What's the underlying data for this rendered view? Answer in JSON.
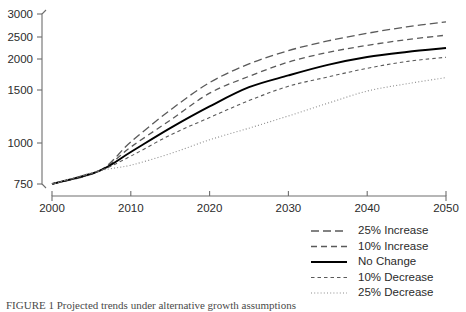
{
  "chart_data": {
    "type": "line",
    "title": "",
    "subtitle": "",
    "xlabel": "",
    "ylabel": "",
    "xlim": [
      2000,
      2050
    ],
    "ylim": [
      750,
      3000
    ],
    "yscale": "nonlinear-compressed",
    "grid": false,
    "legend_position": "bottom-right",
    "xticks": [
      2000,
      2010,
      2020,
      2030,
      2040,
      2050
    ],
    "xtick_labels": [
      "2000",
      "2010",
      "2020",
      "2030",
      "2040",
      "2050"
    ],
    "yticks": [
      750,
      1000,
      1500,
      2000,
      2500,
      3000
    ],
    "ytick_labels": [
      "750",
      "1000",
      "1500",
      "2000",
      "2500",
      "3000"
    ],
    "x": [
      2000,
      2006,
      2010,
      2015,
      2020,
      2025,
      2030,
      2035,
      2040,
      2045,
      2050
    ],
    "series": [
      {
        "name": "25% Increase",
        "dash": "long-dash",
        "color": "#5a5a5a",
        "width": 1.3,
        "values": [
          750,
          830,
          1010,
          1310,
          1620,
          1920,
          2190,
          2410,
          2580,
          2720,
          2830
        ]
      },
      {
        "name": "10% Increase",
        "dash": "medium-dash",
        "color": "#5a5a5a",
        "width": 1.3,
        "values": [
          750,
          830,
          975,
          1215,
          1470,
          1720,
          1950,
          2150,
          2310,
          2440,
          2540
        ]
      },
      {
        "name": "No Change",
        "dash": "solid",
        "color": "#000000",
        "width": 1.9,
        "values": [
          750,
          830,
          945,
          1140,
          1345,
          1545,
          1735,
          1905,
          2045,
          2160,
          2250
        ]
      },
      {
        "name": "10% Decrease",
        "dash": "short-dash",
        "color": "#5a5a5a",
        "width": 1.1,
        "values": [
          750,
          830,
          920,
          1075,
          1240,
          1400,
          1560,
          1710,
          1850,
          1960,
          2040
        ]
      },
      {
        "name": "25% Decrease",
        "dash": "dotted",
        "color": "#8c8c8c",
        "width": 1.1,
        "values": [
          750,
          830,
          865,
          935,
          1030,
          1140,
          1255,
          1375,
          1490,
          1600,
          1700
        ]
      }
    ],
    "legend_entries": [
      {
        "label": "25% Increase"
      },
      {
        "label": "10% Increase"
      },
      {
        "label": "No Change"
      },
      {
        "label": "10% Decrease"
      },
      {
        "label": "25% Decrease"
      }
    ]
  },
  "caption": {
    "text": "FIGURE 1  Projected trends under alternative growth assumptions"
  }
}
